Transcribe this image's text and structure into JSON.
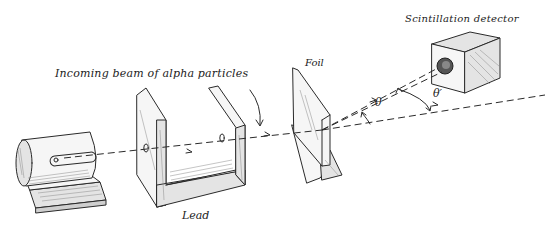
{
  "diagram": {
    "labels": {
      "beam": "Incoming beam of alpha particles",
      "foil": "Foil",
      "detector": "Scintillation detector",
      "lead": "Lead",
      "theta": "θ",
      "theta_prime": "θ′"
    },
    "components": [
      {
        "id": "source",
        "name": "Alpha source"
      },
      {
        "id": "lead",
        "name": "Lead"
      },
      {
        "id": "foil",
        "name": "Foil"
      },
      {
        "id": "detector",
        "name": "Scintillation detector"
      }
    ],
    "colors": {
      "ink": "#2a2a2a",
      "background": "#ffffff"
    }
  }
}
